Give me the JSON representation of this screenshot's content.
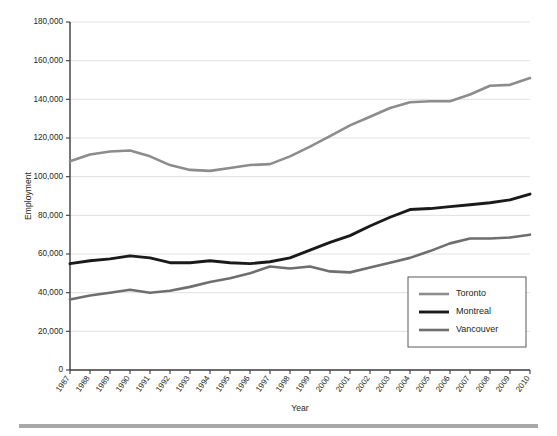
{
  "chart_data": {
    "type": "line",
    "title": "",
    "xlabel": "Year",
    "ylabel": "Employment",
    "grid": "horizontal",
    "legend_position": "bottom-right",
    "xlim": [
      1987,
      2010
    ],
    "ylim": [
      0,
      180000
    ],
    "ytick_step": 20000,
    "categories": [
      "1987",
      "1988",
      "1989",
      "1990",
      "1991",
      "1992",
      "1993",
      "1994",
      "1995",
      "1996",
      "1997",
      "1998",
      "1999",
      "2000",
      "2001",
      "2002",
      "2003",
      "2004",
      "2005",
      "2006",
      "2007",
      "2008",
      "2009",
      "2010"
    ],
    "ytick_labels": [
      "0",
      "20,000",
      "40,000",
      "60,000",
      "80,000",
      "100,000",
      "120,000",
      "140,000",
      "160,000",
      "180,000"
    ],
    "series": [
      {
        "name": "Toronto",
        "color": "#8c8c8c",
        "width": 2.6,
        "values": [
          108000,
          111500,
          113000,
          113500,
          110500,
          106000,
          103500,
          103000,
          104500,
          106000,
          106500,
          110500,
          115500,
          121000,
          126500,
          131000,
          135500,
          138500,
          139000,
          139000,
          142500,
          147000,
          147500,
          151000
        ]
      },
      {
        "name": "Montreal",
        "color": "#1a1a1a",
        "width": 2.9,
        "values": [
          55000,
          56500,
          57500,
          59000,
          58000,
          55500,
          55500,
          56500,
          55500,
          55000,
          56000,
          58000,
          62000,
          66000,
          69500,
          74500,
          79000,
          83000,
          83500,
          84500,
          85500,
          86500,
          88000,
          91000
        ]
      },
      {
        "name": "Vancouver",
        "color": "#6e6e6e",
        "width": 2.6,
        "values": [
          36500,
          38500,
          40000,
          41500,
          40000,
          41000,
          43000,
          45500,
          47500,
          50000,
          53500,
          52500,
          53500,
          51000,
          50500,
          53000,
          55500,
          58000,
          61500,
          65500,
          68000,
          68000,
          68500,
          70000
        ]
      }
    ],
    "toronto_tail": [
      151000,
      155000,
      161500,
      166000,
      170000
    ],
    "montreal_tail": [
      91000,
      95000,
      101000,
      106500,
      108000
    ],
    "vancouver_tail": [
      70000,
      68500,
      69000,
      70500,
      71500
    ]
  },
  "legend": {
    "entries": [
      {
        "label": "Toronto"
      },
      {
        "label": "Montreal"
      },
      {
        "label": "Vancouver"
      }
    ]
  },
  "axes": {
    "x_title": "Year",
    "y_title": "Employment"
  }
}
